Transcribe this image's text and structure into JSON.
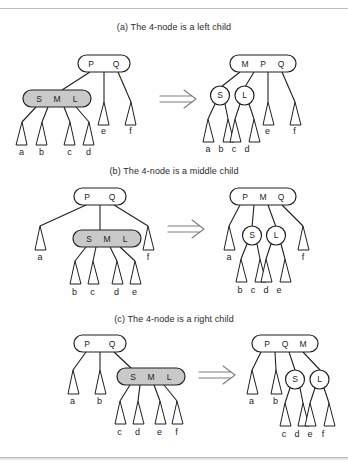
{
  "figure": {
    "type": "diagram",
    "background": "#ffffff",
    "ink": "#231f20",
    "four_node_fill": "#c9c9c9",
    "arrow_color": "#7d7f82",
    "arrow_glyph": "double-right-arrow"
  },
  "panels": [
    {
      "id": "a",
      "caption": "(a) The 4-node is a left child",
      "before": {
        "nodes": [
          {
            "id": "parent",
            "keys": [
              "P",
              "Q"
            ],
            "shape": "3-node",
            "fill": "white"
          },
          {
            "id": "fournode",
            "keys": [
              "S",
              "M",
              "L"
            ],
            "shape": "4-node",
            "fill": "gray"
          }
        ],
        "leaves": [
          "a",
          "b",
          "c",
          "d",
          "e",
          "f"
        ]
      },
      "after": {
        "nodes": [
          {
            "id": "parent",
            "keys": [
              "M",
              "P",
              "Q"
            ],
            "shape": "4-node",
            "fill": "white"
          },
          {
            "id": "left",
            "keys": [
              "S"
            ],
            "shape": "2-node",
            "fill": "white"
          },
          {
            "id": "mid",
            "keys": [
              "L"
            ],
            "shape": "2-node",
            "fill": "white"
          }
        ],
        "leaves": [
          "a",
          "b",
          "c",
          "d",
          "e",
          "f"
        ]
      }
    },
    {
      "id": "b",
      "caption": "(b) The 4-node is a middle child",
      "before": {
        "nodes": [
          {
            "id": "parent",
            "keys": [
              "P",
              "Q"
            ],
            "shape": "3-node",
            "fill": "white"
          },
          {
            "id": "fournode",
            "keys": [
              "S",
              "M",
              "L"
            ],
            "shape": "4-node",
            "fill": "gray"
          }
        ],
        "leaves": [
          "a",
          "b",
          "c",
          "d",
          "e",
          "f"
        ]
      },
      "after": {
        "nodes": [
          {
            "id": "parent",
            "keys": [
              "P",
              "M",
              "Q"
            ],
            "shape": "4-node",
            "fill": "white"
          },
          {
            "id": "left",
            "keys": [
              "S"
            ],
            "shape": "2-node",
            "fill": "white"
          },
          {
            "id": "mid",
            "keys": [
              "L"
            ],
            "shape": "2-node",
            "fill": "white"
          }
        ],
        "leaves": [
          "a",
          "b",
          "c",
          "d",
          "e",
          "f"
        ]
      }
    },
    {
      "id": "c",
      "caption": "(c) The 4-node is a right child",
      "before": {
        "nodes": [
          {
            "id": "parent",
            "keys": [
              "P",
              "Q"
            ],
            "shape": "3-node",
            "fill": "white"
          },
          {
            "id": "fournode",
            "keys": [
              "S",
              "M",
              "L"
            ],
            "shape": "4-node",
            "fill": "gray"
          }
        ],
        "leaves": [
          "a",
          "b",
          "c",
          "d",
          "e",
          "f"
        ]
      },
      "after": {
        "nodes": [
          {
            "id": "parent",
            "keys": [
              "P",
              "Q",
              "M"
            ],
            "shape": "4-node",
            "fill": "white"
          },
          {
            "id": "left",
            "keys": [
              "S"
            ],
            "shape": "2-node",
            "fill": "white"
          },
          {
            "id": "mid",
            "keys": [
              "L"
            ],
            "shape": "2-node",
            "fill": "white"
          }
        ],
        "leaves": [
          "a",
          "b",
          "c",
          "d",
          "e",
          "f"
        ]
      }
    }
  ],
  "labels": {
    "P": "P",
    "Q": "Q",
    "M": "M",
    "S": "S",
    "L": "L",
    "a": "a",
    "b": "b",
    "c": "c",
    "d": "d",
    "e": "e",
    "f": "f"
  }
}
